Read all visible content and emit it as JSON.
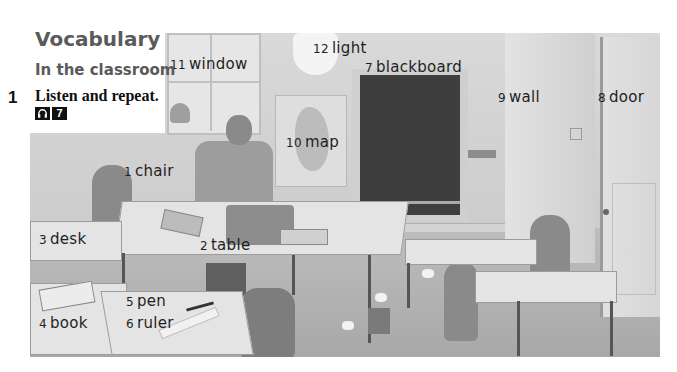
{
  "header": {
    "title": "Vocabulary",
    "subtitle": "In the classroom"
  },
  "exercise": {
    "number": "1",
    "instruction": "Listen and repeat.",
    "audio_icon": "headphones-icon",
    "track": "7"
  },
  "labels": [
    {
      "num": "1",
      "word": "chair"
    },
    {
      "num": "2",
      "word": "table"
    },
    {
      "num": "3",
      "word": "desk"
    },
    {
      "num": "4",
      "word": "book"
    },
    {
      "num": "5",
      "word": "pen"
    },
    {
      "num": "6",
      "word": "ruler"
    },
    {
      "num": "7",
      "word": "blackboard"
    },
    {
      "num": "8",
      "word": "door"
    },
    {
      "num": "9",
      "word": "wall"
    },
    {
      "num": "10",
      "word": "map"
    },
    {
      "num": "11",
      "word": "window"
    },
    {
      "num": "12",
      "word": "light"
    }
  ]
}
